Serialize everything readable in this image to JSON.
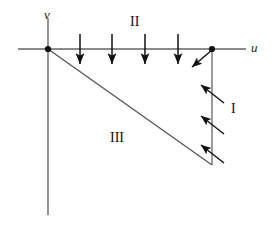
{
  "figure": {
    "background_color": "#ffffff",
    "line_color": "#555555",
    "arrow_color": "#111111",
    "text_color": "#111111",
    "width": 277,
    "height": 229
  },
  "axes": {
    "horizontal": {
      "label": "u",
      "x_start": 18,
      "x_end": 246,
      "y": 49
    },
    "vertical": {
      "label": "v",
      "x": 48,
      "y_start": 18,
      "y_end": 215
    },
    "origin": {
      "x": 48,
      "y": 49
    }
  },
  "points": [
    {
      "name": "origin-dot",
      "x": 48,
      "y": 49
    },
    {
      "name": "u-axis-dot",
      "x": 212,
      "y": 49
    }
  ],
  "segments": [
    {
      "name": "diagonal-hypotenuse",
      "x1": 48,
      "y1": 49,
      "x2": 212,
      "y2": 165
    },
    {
      "name": "vertical-leg",
      "x1": 212,
      "y1": 49,
      "x2": 212,
      "y2": 165
    }
  ],
  "regions": [
    {
      "name": "region-one",
      "label": "I",
      "x": 231,
      "y": 102
    },
    {
      "name": "region-two",
      "label": "II",
      "x": 130,
      "y": 15
    },
    {
      "name": "region-three",
      "label": "III",
      "x": 110,
      "y": 131
    }
  ],
  "down_arrows": {
    "count": 4,
    "y_start": 34,
    "y_end": 66,
    "x_positions": [
      80,
      112,
      145,
      178
    ]
  },
  "diagonal_arrows": {
    "count": 3,
    "description": "arrows pointing up-left across the vertical leg",
    "items": [
      {
        "x1": 224,
        "y1": 103,
        "x2": 201,
        "y2": 85
      },
      {
        "x1": 224,
        "y1": 134,
        "x2": 201,
        "y2": 116
      },
      {
        "x1": 224,
        "y1": 163,
        "x2": 201,
        "y2": 145
      }
    ]
  },
  "corner_arrow": {
    "description": "arrow from the u-axis dot pointing down-left",
    "x1": 212,
    "y1": 50,
    "x2": 192,
    "y2": 67
  }
}
